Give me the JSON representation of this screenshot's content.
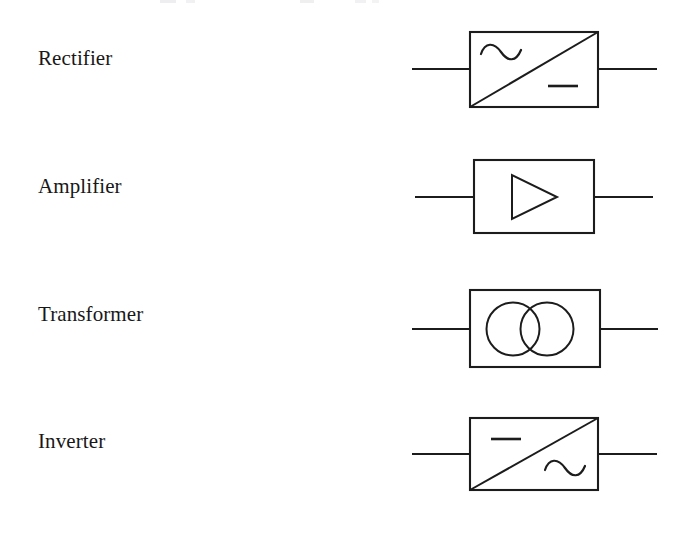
{
  "page": {
    "background_color": "#ffffff",
    "ink_color": "#1c1c1c",
    "text_color": "#181818",
    "width": 688,
    "height": 533
  },
  "rows": [
    {
      "id": "rectifier",
      "label": "Rectifier",
      "label_x": 38,
      "label_y": 68,
      "symbol": {
        "kind": "converter-box-diagonal",
        "box": {
          "x": 470,
          "y": 32,
          "w": 128,
          "h": 75
        },
        "diagonal": {
          "x1": 470,
          "y1": 107,
          "x2": 598,
          "y2": 32
        },
        "lead_y": 69,
        "lead_left": {
          "x1": 412,
          "x2": 470
        },
        "lead_right": {
          "x1": 598,
          "x2": 657
        },
        "ac_marker": {
          "cx": 501,
          "cy": 52,
          "w": 40,
          "amp": 7,
          "corner": "top-left"
        },
        "dc_marker": {
          "x1": 548,
          "x2": 578,
          "y": 86,
          "corner": "bottom-right"
        },
        "input_type": "AC",
        "output_type": "DC"
      }
    },
    {
      "id": "amplifier",
      "label": "Amplifier",
      "label_x": 38,
      "label_y": 196,
      "symbol": {
        "kind": "amplifier-triangle",
        "box": {
          "x": 474,
          "y": 160,
          "w": 120,
          "h": 73
        },
        "triangle": {
          "x1": 512,
          "y1": 175,
          "x2": 512,
          "y2": 219,
          "apex_x": 557,
          "apex_y": 197
        },
        "lead_y": 197,
        "lead_left": {
          "x1": 415,
          "x2": 474
        },
        "lead_right": {
          "x1": 594,
          "x2": 653
        }
      }
    },
    {
      "id": "transformer",
      "label": "Transformer",
      "label_x": 38,
      "label_y": 323,
      "symbol": {
        "kind": "transformer-coupled-circles",
        "box": {
          "x": 470,
          "y": 290,
          "w": 130,
          "h": 77
        },
        "circle_left": {
          "cx": 513,
          "cy": 329,
          "r": 26.5
        },
        "circle_right": {
          "cx": 547,
          "cy": 329,
          "r": 26.5
        },
        "lead_y": 329,
        "lead_left": {
          "x1": 412,
          "x2": 470
        },
        "lead_right": {
          "x1": 600,
          "x2": 658
        }
      }
    },
    {
      "id": "inverter",
      "label": "Inverter",
      "label_x": 38,
      "label_y": 451,
      "symbol": {
        "kind": "converter-box-diagonal",
        "box": {
          "x": 470,
          "y": 418,
          "w": 128,
          "h": 72
        },
        "diagonal": {
          "x1": 470,
          "y1": 490,
          "x2": 598,
          "y2": 418
        },
        "lead_y": 454,
        "lead_left": {
          "x1": 412,
          "x2": 470
        },
        "lead_right": {
          "x1": 598,
          "x2": 657
        },
        "dc_marker": {
          "x1": 491,
          "x2": 521,
          "y": 439,
          "corner": "top-left"
        },
        "ac_marker": {
          "cx": 565,
          "cy": 468,
          "w": 40,
          "amp": 7,
          "corner": "bottom-right"
        },
        "input_type": "DC",
        "output_type": "AC"
      }
    }
  ]
}
